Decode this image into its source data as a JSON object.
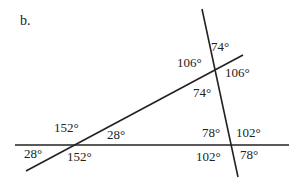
{
  "part_label": "b.",
  "colors": {
    "line": "#222222",
    "text": "#222222",
    "background": "#ffffff"
  },
  "lines": [
    {
      "name": "steep-transversal",
      "x1": 202,
      "y1": 9,
      "x2": 238,
      "y2": 177
    },
    {
      "name": "slanted-line",
      "x1": 26,
      "y1": 171,
      "x2": 243,
      "y2": 55
    },
    {
      "name": "horizontal-line",
      "x1": 15,
      "y1": 145,
      "x2": 289,
      "y2": 145
    }
  ],
  "angles": {
    "upper_intersection": {
      "top_right": "74°",
      "top_left": "106°",
      "bottom_right": "106°",
      "bottom_left": "74°"
    },
    "left_intersection": {
      "top_left": "152°",
      "top_right": "28°",
      "bottom_left": "28°",
      "bottom_right": "152°"
    },
    "right_intersection": {
      "top_left": "78°",
      "top_right": "102°",
      "bottom_left": "102°",
      "bottom_right": "78°"
    }
  }
}
